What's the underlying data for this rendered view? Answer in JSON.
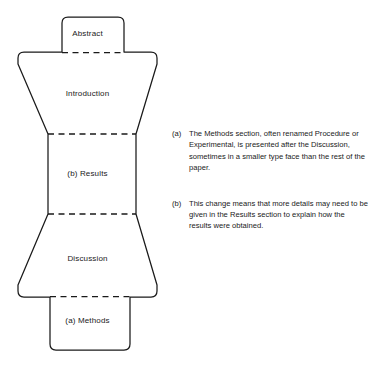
{
  "figure": {
    "type": "hourglass-imrad-diagram",
    "background_color": "#ffffff",
    "line_color": "#1a1a1a",
    "sections": [
      {
        "key": "abstract",
        "label": "Abstract"
      },
      {
        "key": "introduction",
        "label": "Introduction"
      },
      {
        "key": "results",
        "label": "(b) Results"
      },
      {
        "key": "discussion",
        "label": "Discussion"
      },
      {
        "key": "methods",
        "label": "(a) Methods"
      }
    ]
  },
  "notes": [
    {
      "marker": "(a)",
      "text": "The Methods section, often renamed Procedure or Experimental, is presented after the Discussion, sometimes in a smaller type face than the rest of the paper."
    },
    {
      "marker": "(b)",
      "text": "This change means that more details may need to be given in the Results section to explain how the results were obtained."
    }
  ]
}
